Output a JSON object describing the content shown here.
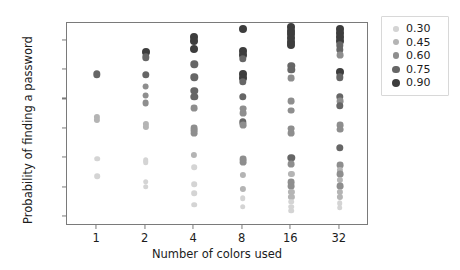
{
  "chart_data": {
    "type": "scatter",
    "title": "",
    "xlabel": "Number of colors used",
    "ylabel": "Probability of finding a password",
    "x_categories": [
      "1",
      "2",
      "4",
      "8",
      "16",
      "32"
    ],
    "x_tick_labels": [
      "1",
      "2",
      "4",
      "8",
      "16",
      "32"
    ],
    "y_tick_labels": [
      "0%",
      "10%",
      "20%",
      "30%",
      "40%",
      "50%",
      "60%"
    ],
    "y_tick_values": [
      0,
      10,
      20,
      30,
      40,
      50,
      60
    ],
    "ylim": [
      -3,
      66
    ],
    "grid": false,
    "legend_position": "right-outside",
    "legend_title": "",
    "legend_entries": [
      {
        "label": "0.30",
        "alpha": 0.3,
        "color": "#d4d4d4",
        "radius_px": 2.8
      },
      {
        "label": "0.45",
        "alpha": 0.45,
        "color": "#b4b4b4",
        "radius_px": 3.1
      },
      {
        "label": "0.60",
        "alpha": 0.6,
        "color": "#8e8e8e",
        "radius_px": 3.4
      },
      {
        "label": "0.75",
        "alpha": 0.75,
        "color": "#666666",
        "radius_px": 3.7
      },
      {
        "label": "0.90",
        "alpha": 0.9,
        "color": "#3d3d3d",
        "radius_px": 4.0
      }
    ],
    "marker_shape": "circle",
    "marker_color_scale": "greyscale-by-alpha",
    "series": [
      {
        "name": "1",
        "x_category": "1",
        "points": [
          {
            "y": 48.6,
            "alpha": 0.75
          },
          {
            "y": 34.2,
            "alpha": 0.45
          },
          {
            "y": 33.0,
            "alpha": 0.45
          },
          {
            "y": 19.9,
            "alpha": 0.3
          },
          {
            "y": 13.9,
            "alpha": 0.3
          }
        ]
      },
      {
        "name": "2",
        "x_category": "2",
        "points": [
          {
            "y": 56.2,
            "alpha": 0.9
          },
          {
            "y": 54.3,
            "alpha": 0.75
          },
          {
            "y": 48.4,
            "alpha": 0.75
          },
          {
            "y": 44.4,
            "alpha": 0.6
          },
          {
            "y": 41.3,
            "alpha": 0.6
          },
          {
            "y": 38.9,
            "alpha": 0.6
          },
          {
            "y": 31.8,
            "alpha": 0.45
          },
          {
            "y": 30.8,
            "alpha": 0.45
          },
          {
            "y": 19.4,
            "alpha": 0.3
          },
          {
            "y": 18.6,
            "alpha": 0.3
          },
          {
            "y": 12.1,
            "alpha": 0.3
          },
          {
            "y": 10.3,
            "alpha": 0.3
          }
        ]
      },
      {
        "name": "4",
        "x_category": "4",
        "points": [
          {
            "y": 61.4,
            "alpha": 0.9
          },
          {
            "y": 60.0,
            "alpha": 0.9
          },
          {
            "y": 57.0,
            "alpha": 0.9
          },
          {
            "y": 51.9,
            "alpha": 0.75
          },
          {
            "y": 47.6,
            "alpha": 0.75
          },
          {
            "y": 42.9,
            "alpha": 0.75
          },
          {
            "y": 41.0,
            "alpha": 0.75
          },
          {
            "y": 37.0,
            "alpha": 0.6
          },
          {
            "y": 30.2,
            "alpha": 0.6
          },
          {
            "y": 29.4,
            "alpha": 0.6
          },
          {
            "y": 28.6,
            "alpha": 0.6
          },
          {
            "y": 21.2,
            "alpha": 0.45
          },
          {
            "y": 16.9,
            "alpha": 0.3
          },
          {
            "y": 11.3,
            "alpha": 0.3
          },
          {
            "y": 8.1,
            "alpha": 0.3
          },
          {
            "y": 4.3,
            "alpha": 0.3
          }
        ]
      },
      {
        "name": "8",
        "x_category": "8",
        "points": [
          {
            "y": 63.9,
            "alpha": 0.9
          },
          {
            "y": 56.4,
            "alpha": 0.9
          },
          {
            "y": 55.0,
            "alpha": 0.9
          },
          {
            "y": 53.8,
            "alpha": 0.75
          },
          {
            "y": 48.8,
            "alpha": 0.9
          },
          {
            "y": 47.4,
            "alpha": 0.9
          },
          {
            "y": 46.1,
            "alpha": 0.75
          },
          {
            "y": 41.0,
            "alpha": 0.75
          },
          {
            "y": 36.9,
            "alpha": 0.6
          },
          {
            "y": 35.5,
            "alpha": 0.6
          },
          {
            "y": 32.3,
            "alpha": 0.75
          },
          {
            "y": 31.2,
            "alpha": 0.6
          },
          {
            "y": 19.8,
            "alpha": 0.6
          },
          {
            "y": 18.6,
            "alpha": 0.6
          },
          {
            "y": 14.4,
            "alpha": 0.45
          },
          {
            "y": 9.6,
            "alpha": 0.45
          },
          {
            "y": 6.4,
            "alpha": 0.3
          },
          {
            "y": 3.6,
            "alpha": 0.3
          }
        ]
      },
      {
        "name": "16",
        "x_category": "16",
        "points": [
          {
            "y": 64.6,
            "alpha": 0.9
          },
          {
            "y": 63.4,
            "alpha": 0.9
          },
          {
            "y": 62.2,
            "alpha": 0.9
          },
          {
            "y": 61.0,
            "alpha": 0.9
          },
          {
            "y": 59.6,
            "alpha": 0.9
          },
          {
            "y": 58.4,
            "alpha": 0.9
          },
          {
            "y": 51.4,
            "alpha": 0.75
          },
          {
            "y": 50.0,
            "alpha": 0.75
          },
          {
            "y": 47.2,
            "alpha": 0.6
          },
          {
            "y": 39.5,
            "alpha": 0.6
          },
          {
            "y": 36.2,
            "alpha": 0.6
          },
          {
            "y": 30.1,
            "alpha": 0.6
          },
          {
            "y": 28.6,
            "alpha": 0.6
          },
          {
            "y": 20.2,
            "alpha": 0.75
          },
          {
            "y": 18.0,
            "alpha": 0.6
          },
          {
            "y": 14.6,
            "alpha": 0.45
          },
          {
            "y": 11.9,
            "alpha": 0.6
          },
          {
            "y": 10.5,
            "alpha": 0.6
          },
          {
            "y": 8.6,
            "alpha": 0.45
          },
          {
            "y": 6.8,
            "alpha": 0.45
          },
          {
            "y": 5.2,
            "alpha": 0.3
          },
          {
            "y": 3.6,
            "alpha": 0.3
          },
          {
            "y": 2.2,
            "alpha": 0.3
          }
        ]
      },
      {
        "name": "32",
        "x_category": "32",
        "points": [
          {
            "y": 64.0,
            "alpha": 0.9
          },
          {
            "y": 62.6,
            "alpha": 0.9
          },
          {
            "y": 61.4,
            "alpha": 0.9
          },
          {
            "y": 60.0,
            "alpha": 0.9
          },
          {
            "y": 58.4,
            "alpha": 0.75
          },
          {
            "y": 56.8,
            "alpha": 0.75
          },
          {
            "y": 55.0,
            "alpha": 0.6
          },
          {
            "y": 49.4,
            "alpha": 0.9
          },
          {
            "y": 47.6,
            "alpha": 0.75
          },
          {
            "y": 41.0,
            "alpha": 0.75
          },
          {
            "y": 39.4,
            "alpha": 0.6
          },
          {
            "y": 37.8,
            "alpha": 0.75
          },
          {
            "y": 31.4,
            "alpha": 0.6
          },
          {
            "y": 29.8,
            "alpha": 0.6
          },
          {
            "y": 23.6,
            "alpha": 0.75
          },
          {
            "y": 17.8,
            "alpha": 0.6
          },
          {
            "y": 16.2,
            "alpha": 0.45
          },
          {
            "y": 14.6,
            "alpha": 0.6
          },
          {
            "y": 12.6,
            "alpha": 0.45
          },
          {
            "y": 10.6,
            "alpha": 0.6
          },
          {
            "y": 8.6,
            "alpha": 0.45
          },
          {
            "y": 6.8,
            "alpha": 0.45
          },
          {
            "y": 4.8,
            "alpha": 0.3
          },
          {
            "y": 3.2,
            "alpha": 0.3
          }
        ]
      }
    ]
  }
}
